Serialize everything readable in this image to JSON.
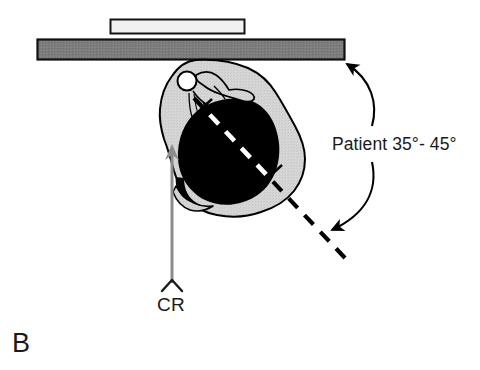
{
  "figure": {
    "panel_label": "B",
    "type": "radiographic-positioning-diagram",
    "annotations": {
      "patient_angle_label": "Patient 35°- 45°",
      "central_ray_label": "CR"
    },
    "elements": {
      "image_receptor_bar": {
        "name": "upright-bucky-grid-bar",
        "fill": "#7d7d7d",
        "stroke": "#0d0d0d"
      },
      "cassette": {
        "name": "cassette-film-holder",
        "fill": "#f0f0f0",
        "stroke": "#111111"
      },
      "body_cross_section": {
        "name": "torso-shoulder-soft-tissue",
        "fill": "#d4d4d4",
        "stroke": "#000000"
      },
      "lung_field": {
        "name": "lung-air-density-region",
        "fill": "#000000"
      },
      "humeral_head": {
        "name": "humeral-head",
        "fill": "#ffffff",
        "stroke": "#000000"
      },
      "clavicle": {
        "name": "clavicle-scapular-spine",
        "fill": "#d4d4d4",
        "stroke": "#000000"
      },
      "central_ray_arrow": {
        "name": "central-ray-arrow",
        "color": "#8c8c8c",
        "direction": "up"
      },
      "angle_reference_line": {
        "name": "body-plane-dashed-line",
        "style": "dashed",
        "color_over_lung": "#ffffff",
        "color_outside": "#000000"
      },
      "rotation_arc_upper": {
        "name": "rotation-arc-arrow-upper",
        "color": "#000000"
      },
      "rotation_arc_lower": {
        "name": "rotation-arc-arrow-lower",
        "color": "#000000"
      }
    },
    "colors": {
      "background": "#ffffff",
      "bar_gray": "#7d7d7d",
      "tissue_gray": "#d4d4d4",
      "ray_gray": "#8c8c8c",
      "ink": "#000000"
    }
  }
}
